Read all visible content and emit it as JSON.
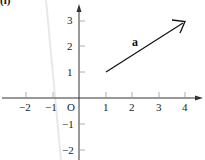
{
  "figure": {
    "label": "(i)",
    "vector_label": "a",
    "origin_label": "O",
    "x_ticks": [
      {
        "value": -2,
        "label": "−2"
      },
      {
        "value": -1,
        "label": "−1"
      },
      {
        "value": 1,
        "label": "1"
      },
      {
        "value": 2,
        "label": "2"
      },
      {
        "value": 3,
        "label": "3"
      },
      {
        "value": 4,
        "label": "4"
      }
    ],
    "y_ticks": [
      {
        "value": 3,
        "label": "3"
      },
      {
        "value": 2,
        "label": "2"
      },
      {
        "value": 1,
        "label": "1"
      },
      {
        "value": -1,
        "label": "−1"
      },
      {
        "value": -2,
        "label": "−2"
      }
    ],
    "vector": {
      "from": [
        1,
        1
      ],
      "to": [
        4,
        3
      ]
    },
    "colors": {
      "axis": "#333333",
      "vector": "#111111",
      "fold_shadow": "#e6e6e6"
    }
  }
}
